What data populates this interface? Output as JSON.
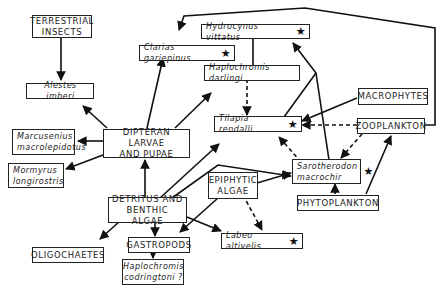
{
  "diagram": {
    "type": "food-web",
    "nodes": {
      "terrestrial_insects": {
        "line1": "TERRESTRIAL",
        "line2": "INSECTS"
      },
      "alestes": {
        "label": "Alestes imberi"
      },
      "clarias": {
        "label": "Clarias gariepinus",
        "protected": "★"
      },
      "hydrocynus": {
        "label": "Hydrocynus vittatus",
        "protected": "★"
      },
      "haplochromis_darlingi": {
        "label": "Haplochromis darlingi"
      },
      "tilapia": {
        "label": "Tilapia rendalli",
        "protected": "★"
      },
      "macrophytes": {
        "label": "MACROPHYTES"
      },
      "zooplankton": {
        "label": "ZOOPLANKTON"
      },
      "dipteran": {
        "line1": "DIPTERAN LARVAE",
        "line2": "AND PUPAE"
      },
      "marcusenius": {
        "line1": "Marcusenius",
        "line2": "macrolepidotus"
      },
      "mormyrus": {
        "line1": "Mormyrus",
        "line2": "longirostris"
      },
      "sarotherodon": {
        "line1": "Sarotherodon",
        "line2": "macrochir",
        "protected": "★"
      },
      "epiphytic": {
        "line1": "EPIPHYTIC",
        "line2": "ALGAE"
      },
      "phytoplankton": {
        "label": "PHYTOPLANKTON"
      },
      "detritus": {
        "line1": "DETRITUS AND",
        "line2": "BENTHIC ALGAE"
      },
      "oligochaetes": {
        "label": "OLIGOCHAETES"
      },
      "gastropods": {
        "label": "GASTROPODS"
      },
      "labeo": {
        "label": "Labeo altivelis",
        "protected": "★"
      },
      "haplochromis_codringtoni": {
        "line1": "Haplochromis",
        "line2": "codringtoni ?"
      }
    },
    "edges": [
      {
        "from": "TERRESTRIAL INSECTS",
        "to": "Alestes imberi",
        "style": "solid"
      },
      {
        "from": "DIPTERAN LARVAE AND PUPAE",
        "to": "Alestes imberi",
        "style": "solid"
      },
      {
        "from": "DIPTERAN LARVAE AND PUPAE",
        "to": "Clarias gariepinus",
        "style": "solid"
      },
      {
        "from": "DIPTERAN LARVAE AND PUPAE",
        "to": "Haplochromis darlingi",
        "style": "solid"
      },
      {
        "from": "DIPTERAN LARVAE AND PUPAE",
        "to": "Marcusenius macrolepidotus",
        "style": "solid"
      },
      {
        "from": "DIPTERAN LARVAE AND PUPAE",
        "to": "Mormyrus longirostris",
        "style": "solid"
      },
      {
        "from": "DETRITUS AND BENTHIC ALGAE",
        "to": "DIPTERAN LARVAE AND PUPAE",
        "style": "solid"
      },
      {
        "from": "DETRITUS AND BENTHIC ALGAE",
        "to": "Tilapia rendalli",
        "style": "solid"
      },
      {
        "from": "DETRITUS AND BENTHIC ALGAE",
        "to": "Sarotherodon macrochir",
        "style": "solid"
      },
      {
        "from": "DETRITUS AND BENTHIC ALGAE",
        "to": "OLIGOCHAETES",
        "style": "solid"
      },
      {
        "from": "DETRITUS AND BENTHIC ALGAE",
        "to": "GASTROPODS",
        "style": "solid"
      },
      {
        "from": "DETRITUS AND BENTHIC ALGAE",
        "to": "Labeo altivelis",
        "style": "solid"
      },
      {
        "from": "EPIPHYTIC ALGAE",
        "to": "GASTROPODS",
        "style": "solid"
      },
      {
        "from": "EPIPHYTIC ALGAE",
        "to": "Sarotherodon macrochir",
        "style": "solid"
      },
      {
        "from": "EPIPHYTIC ALGAE",
        "to": "Labeo altivelis",
        "style": "dashed"
      },
      {
        "from": "GASTROPODS",
        "to": "Haplochromis codringtoni ?",
        "style": "solid"
      },
      {
        "from": "Haplochromis darlingi",
        "to": "Hydrocynus vittatus",
        "style": "solid"
      },
      {
        "from": "Haplochromis darlingi",
        "to": "Tilapia rendalli",
        "style": "dashed"
      },
      {
        "from": "Tilapia rendalli",
        "to": "Hydrocynus vittatus",
        "style": "solid"
      },
      {
        "from": "Sarotherodon macrochir",
        "to": "Hydrocynus vittatus",
        "style": "solid"
      },
      {
        "from": "Sarotherodon macrochir",
        "to": "Tilapia rendalli",
        "style": "dashed"
      },
      {
        "from": "MACROPHYTES",
        "to": "Tilapia rendalli",
        "style": "solid"
      },
      {
        "from": "ZOOPLANKTON",
        "to": "Tilapia rendalli",
        "style": "dashed"
      },
      {
        "from": "ZOOPLANKTON",
        "to": "Sarotherodon macrochir",
        "style": "dashed"
      },
      {
        "from": "ZOOPLANKTON",
        "to": "Clarias gariepinus",
        "style": "solid"
      },
      {
        "from": "PHYTOPLANKTON",
        "to": "Sarotherodon macrochir",
        "style": "solid"
      },
      {
        "from": "PHYTOPLANKTON",
        "to": "ZOOPLANKTON",
        "style": "solid"
      }
    ]
  }
}
